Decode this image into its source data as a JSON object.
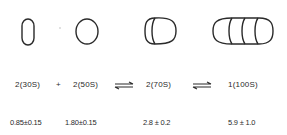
{
  "diagram": {
    "particles": [
      {
        "id": "30S",
        "lobes": 1,
        "shape": "narrow-oval"
      },
      {
        "id": "50S",
        "lobes": 1,
        "shape": "circle"
      },
      {
        "id": "70S",
        "lobes": 2,
        "shape": "double-lobe"
      },
      {
        "id": "100S",
        "lobes": 4,
        "shape": "quadruple-lobe"
      }
    ],
    "equation": {
      "term1": "2(30S)",
      "plus": "+",
      "term2": "2(50S)",
      "term3": "2(70S)",
      "term4": "1(100S)"
    },
    "values": {
      "v30S": "0.85±0.15",
      "v50S": "1.80±0.15",
      "v70S": "2.8 ± 0.2",
      "v100S": "5.9 ± 1.0"
    },
    "colors": {
      "stroke": "#2a2a2a",
      "background": "#ffffff"
    }
  }
}
